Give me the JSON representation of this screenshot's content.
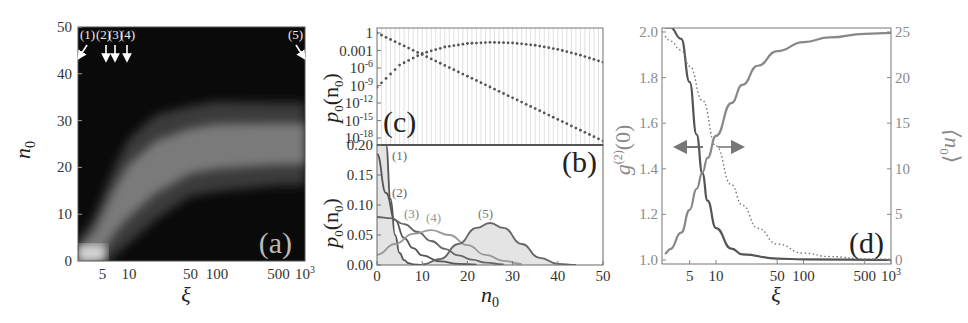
{
  "figure": {
    "panels": [
      "(a)",
      "(b)",
      "(c)",
      "(d)"
    ]
  },
  "chart_data": [
    {
      "panel": "(a)",
      "type": "heatmap",
      "title": "",
      "panel_label": "(a)",
      "xlabel": "ξ",
      "ylabel": "n0",
      "x_scale": "log",
      "x_ticks": [
        "5",
        "10",
        "50",
        "100",
        "500",
        "10³"
      ],
      "x_tick_values": [
        5,
        10,
        50,
        100,
        500,
        1000
      ],
      "y_ticks": [
        "0",
        "10",
        "20",
        "30",
        "40",
        "50"
      ],
      "y_tick_values": [
        0,
        10,
        20,
        30,
        40,
        50
      ],
      "xlim": [
        2.6,
        1000
      ],
      "ylim": [
        0,
        50
      ],
      "colormap": "grayscale (black = 0, white = high probability)",
      "ridge": {
        "description": "bright band of p0(n0) following mean <n0>(ξ), rising from ~0 at small ξ to ~25 at large ξ",
        "xi": [
          2.6,
          4,
          5,
          7,
          10,
          20,
          50,
          100,
          500,
          1000
        ],
        "center_n0": [
          1,
          3,
          6,
          11,
          15,
          20,
          23.5,
          24.5,
          25,
          25
        ],
        "half_width_n0": [
          2,
          4,
          5,
          6,
          7,
          7,
          6,
          6,
          5.5,
          5.5
        ]
      },
      "annotations": [
        {
          "label": "(1)",
          "xi": 2.6,
          "arrow": "diagonal"
        },
        {
          "label": "(2)",
          "xi": 5,
          "arrow": "down"
        },
        {
          "label": "(3)",
          "xi": 7,
          "arrow": "down"
        },
        {
          "label": "(4)",
          "xi": 10,
          "arrow": "down"
        },
        {
          "label": "(5)",
          "xi": 1000,
          "arrow": "diagonal"
        }
      ]
    },
    {
      "panel": "(b)",
      "type": "line",
      "panel_label": "(b)",
      "xlabel": "n0",
      "ylabel": "p0(n0)",
      "xlim": [
        0,
        50
      ],
      "ylim": [
        0,
        0.2
      ],
      "x_ticks": [
        "0",
        "10",
        "20",
        "30",
        "40",
        "50"
      ],
      "y_ticks": [
        "0.00",
        "0.05",
        "0.10",
        "0.15",
        "0.20"
      ],
      "series": [
        {
          "name": "(1)",
          "x": [
            0,
            1,
            2,
            3,
            4,
            5,
            6,
            7,
            8,
            10
          ],
          "values": [
            0.5,
            0.3,
            0.2,
            0.11,
            0.05,
            0.02,
            0.008,
            0.003,
            0.001,
            0.0
          ],
          "filled": true,
          "color": "#555555"
        },
        {
          "name": "(2)",
          "x": [
            0,
            2,
            4,
            6,
            8,
            10,
            14,
            18,
            22
          ],
          "values": [
            0.185,
            0.12,
            0.075,
            0.045,
            0.028,
            0.016,
            0.006,
            0.002,
            0.0005
          ],
          "filled": false,
          "color": "#555555"
        },
        {
          "name": "(3)",
          "x": [
            0,
            3,
            6,
            9,
            12,
            15,
            18,
            21,
            24,
            28
          ],
          "values": [
            0.08,
            0.078,
            0.068,
            0.055,
            0.04,
            0.027,
            0.016,
            0.009,
            0.004,
            0.001
          ],
          "filled": false,
          "color": "#666666"
        },
        {
          "name": "(4)",
          "x": [
            0,
            4,
            8,
            12,
            16,
            20,
            24,
            28,
            32
          ],
          "values": [
            0.017,
            0.035,
            0.052,
            0.058,
            0.05,
            0.033,
            0.017,
            0.007,
            0.002
          ],
          "filled": false,
          "color": "#999999"
        },
        {
          "name": "(5)",
          "x": [
            10,
            14,
            18,
            22,
            25,
            28,
            32,
            36,
            40,
            44
          ],
          "values": [
            0.001,
            0.01,
            0.035,
            0.062,
            0.07,
            0.062,
            0.035,
            0.012,
            0.002,
            0.0
          ],
          "filled": true,
          "color": "#666666"
        }
      ]
    },
    {
      "panel": "(c)",
      "type": "scatter",
      "panel_label": "(c)",
      "xlabel": "n0",
      "ylabel": "p0(n0)",
      "y_scale": "log",
      "xlim": [
        0,
        50
      ],
      "ylim": [
        1e-19,
        1
      ],
      "y_ticks": [
        "1",
        "0.001",
        "10⁻⁶",
        "10⁻⁹",
        "10⁻¹²",
        "10⁻¹⁵",
        "10⁻¹⁸"
      ],
      "series": [
        {
          "name": "(1) thermal-like decay",
          "x": [
            0,
            10,
            20,
            30,
            40,
            50
          ],
          "log10_values": [
            0,
            -3.7,
            -7.4,
            -11.1,
            -14.8,
            -18.5
          ],
          "style": "dotted"
        },
        {
          "name": "(5) condensed distribution",
          "x": [
            0,
            5,
            10,
            15,
            20,
            25,
            30,
            35,
            40,
            45,
            50
          ],
          "log10_values": [
            -9.3,
            -5.5,
            -3.5,
            -2.4,
            -1.8,
            -1.6,
            -1.7,
            -2.1,
            -2.8,
            -3.8,
            -5.0
          ],
          "style": "dotted"
        }
      ]
    },
    {
      "panel": "(d)",
      "type": "line",
      "panel_label": "(d)",
      "xlabel": "ξ",
      "ylabel_left": "g(2)(0)",
      "ylabel_right": "⟨n0⟩",
      "x_scale": "log",
      "xlim": [
        2.6,
        1000
      ],
      "ylim_left": [
        1.0,
        2.0
      ],
      "ylim_right": [
        0,
        25
      ],
      "x_ticks": [
        "5",
        "10",
        "50",
        "100",
        "500",
        "10³"
      ],
      "y_ticks_left": [
        "1.0",
        "1.2",
        "1.4",
        "1.6",
        "1.8",
        "2.0"
      ],
      "y_ticks_right": [
        "0",
        "5",
        "10",
        "15",
        "20",
        "25"
      ],
      "series": [
        {
          "name": "g(2)(0) solid",
          "axis": "left",
          "x": [
            2.6,
            3,
            4,
            5,
            6,
            7,
            8,
            10,
            15,
            20,
            50,
            100,
            1000
          ],
          "values": [
            2.02,
            2.02,
            1.97,
            1.78,
            1.55,
            1.38,
            1.26,
            1.14,
            1.05,
            1.025,
            1.006,
            1.003,
            1.0
          ],
          "style": "solid",
          "color": "#555555"
        },
        {
          "name": "g(2)(0) dotted",
          "axis": "left",
          "x": [
            2.6,
            3,
            4,
            5,
            7,
            10,
            15,
            20,
            30,
            50,
            100,
            200,
            500,
            1000
          ],
          "values": [
            1.98,
            1.96,
            1.92,
            1.85,
            1.7,
            1.5,
            1.33,
            1.24,
            1.14,
            1.07,
            1.03,
            1.015,
            1.005,
            1.003
          ],
          "style": "dotted",
          "color": "#777777"
        },
        {
          "name": "⟨n0⟩",
          "axis": "right",
          "x": [
            2.6,
            3,
            4,
            5,
            6,
            7,
            8,
            10,
            15,
            20,
            30,
            50,
            100,
            200,
            500,
            1000
          ],
          "values": [
            0.7,
            1.2,
            3,
            5.5,
            7.8,
            9.6,
            11.2,
            13.6,
            17.2,
            19.2,
            21.3,
            22.9,
            23.9,
            24.4,
            24.8,
            24.9
          ],
          "style": "solid",
          "color": "#888888"
        }
      ],
      "annotations": [
        {
          "type": "arrow-left",
          "points_to": "left axis (g(2)(0))"
        },
        {
          "type": "arrow-right",
          "points_to": "right axis (⟨n0⟩)"
        }
      ]
    }
  ],
  "labels": {
    "a": {
      "tag": "(a)",
      "xlabel": "ξ",
      "ylabel_base": "n",
      "ylabel_sub": "0",
      "xticks": [
        "5",
        "10",
        "50",
        "100",
        "500"
      ],
      "xtick_last_base": "10",
      "xtick_last_exp": "3",
      "yticks": [
        "0",
        "10",
        "20",
        "30",
        "40",
        "50"
      ],
      "arrows": [
        "(1)",
        "(2)",
        "(3)",
        "(4)",
        "(5)"
      ]
    },
    "b": {
      "tag": "(b)",
      "xlabel_base": "n",
      "xlabel_sub": "0",
      "ylabel_p": "p",
      "ylabel_sub": "0",
      "ylabel_arg": "(n",
      "ylabel_arg_sub": "0",
      "ylabel_close": ")",
      "xticks": [
        "0",
        "10",
        "20",
        "30",
        "40",
        "50"
      ],
      "yticks": [
        "0.00",
        "0.05",
        "0.10",
        "0.15",
        "0.20"
      ],
      "curves": [
        "(1)",
        "(2)",
        "(3)",
        "(4)",
        "(5)"
      ]
    },
    "c": {
      "tag": "(c)",
      "yticks": [
        {
          "base": "1",
          "exp": ""
        },
        {
          "base": "0.001",
          "exp": ""
        },
        {
          "base": "10",
          "exp": "-6"
        },
        {
          "base": "10",
          "exp": "-9"
        },
        {
          "base": "10",
          "exp": "-12"
        },
        {
          "base": "10",
          "exp": "-15"
        },
        {
          "base": "10",
          "exp": "-18"
        }
      ]
    },
    "d": {
      "tag": "(d)",
      "xlabel": "ξ",
      "xticks": [
        "5",
        "10",
        "50",
        "100",
        "500"
      ],
      "xtick_last_base": "10",
      "xtick_last_exp": "3",
      "yticks_left": [
        "1.0",
        "1.2",
        "1.4",
        "1.6",
        "1.8",
        "2.0"
      ],
      "yticks_right": [
        "0",
        "5",
        "10",
        "15",
        "20",
        "25"
      ],
      "ylabel_left_g": "g",
      "ylabel_left_sup": "(2)",
      "ylabel_left_arg": "(0)",
      "ylabel_right": "⟨n",
      "ylabel_right_sub": "0",
      "ylabel_right_close": "⟩"
    }
  },
  "colors": {
    "axis": "#555555",
    "heat_dark": "#0a0a0a",
    "fill_gray": "#e6e6e6",
    "curve_dark": "#555555",
    "curve_mid": "#707070",
    "curve_light": "#9a9a9a",
    "gray_text": "#8a8a8a"
  }
}
